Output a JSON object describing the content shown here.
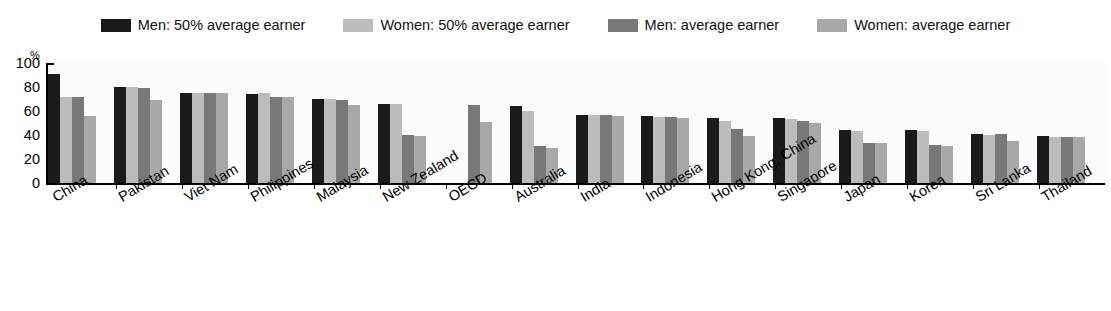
{
  "legend": {
    "position": "top-center",
    "entries": [
      {
        "label": "Men: 50% average earner",
        "color": "#1a1a1a",
        "icon": "legend-swatch-icon"
      },
      {
        "label": "Women: 50% average earner",
        "color": "#bcbcbc",
        "icon": "legend-swatch-icon"
      },
      {
        "label": "Men: average earner",
        "color": "#787878",
        "icon": "legend-swatch-icon"
      },
      {
        "label": "Women: average earner",
        "color": "#a8a8a8",
        "icon": "legend-swatch-icon"
      }
    ]
  },
  "axes": {
    "y_unit": "%",
    "y_ticks": [
      "100",
      "80",
      "60",
      "40",
      "20",
      "0"
    ]
  },
  "chart_data": {
    "type": "bar",
    "title": "",
    "xlabel": "",
    "ylabel": "%",
    "ylim": [
      0,
      100
    ],
    "yticks": [
      0,
      20,
      40,
      60,
      80,
      100
    ],
    "grid": false,
    "legend_position": "top-center",
    "categories": [
      "China",
      "Pakistan",
      "Viet Nam",
      "Philippines",
      "Malaysia",
      "New Zealand",
      "OECD",
      "Australia",
      "India",
      "Indonesia",
      "Hong Kong, China",
      "Singapore",
      "Japan",
      "Korea",
      "Sri Lanka",
      "Thailand"
    ],
    "series": [
      {
        "name": "Men: 50% average earner",
        "color": "#1a1a1a",
        "values": [
          91,
          80,
          75,
          74,
          70,
          66,
          null,
          64,
          57,
          56,
          54,
          54,
          44,
          44,
          41,
          39
        ]
      },
      {
        "name": "Women: 50% average earner",
        "color": "#bcbcbc",
        "values": [
          72,
          80,
          75,
          75,
          70,
          66,
          null,
          60,
          57,
          55,
          52,
          53,
          43,
          43,
          40,
          38
        ]
      },
      {
        "name": "Men: average earner",
        "color": "#787878",
        "values": [
          72,
          79,
          75,
          72,
          69,
          40,
          65,
          31,
          57,
          55,
          45,
          52,
          33,
          32,
          41,
          38
        ]
      },
      {
        "name": "Women: average earner",
        "color": "#a8a8a8",
        "values": [
          56,
          69,
          75,
          72,
          65,
          39,
          51,
          29,
          56,
          54,
          39,
          50,
          33,
          31,
          35,
          38
        ]
      }
    ]
  }
}
